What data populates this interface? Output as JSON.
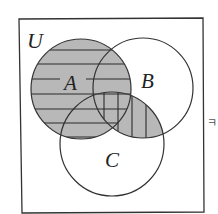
{
  "diagram": {
    "type": "venn",
    "universe_label": "U",
    "sets": [
      {
        "id": "A",
        "label": "A",
        "cx": 81,
        "cy": 89,
        "r": 50
      },
      {
        "id": "B",
        "label": "B",
        "cx": 143,
        "cy": 88,
        "r": 50
      },
      {
        "id": "C",
        "label": "C",
        "cx": 112,
        "cy": 144,
        "r": 52
      }
    ],
    "shaded_regions": [
      {
        "region": "A",
        "fill": "gray",
        "hatch": "horizontal"
      },
      {
        "region": "B∩C",
        "fill": "gray",
        "hatch": "vertical"
      }
    ],
    "colors": {
      "outline": "#333333",
      "shade": "#b8b8b8",
      "hatch": "#2a2a2a",
      "background": "#ffffff"
    },
    "side_glyph": "ㅋ"
  }
}
